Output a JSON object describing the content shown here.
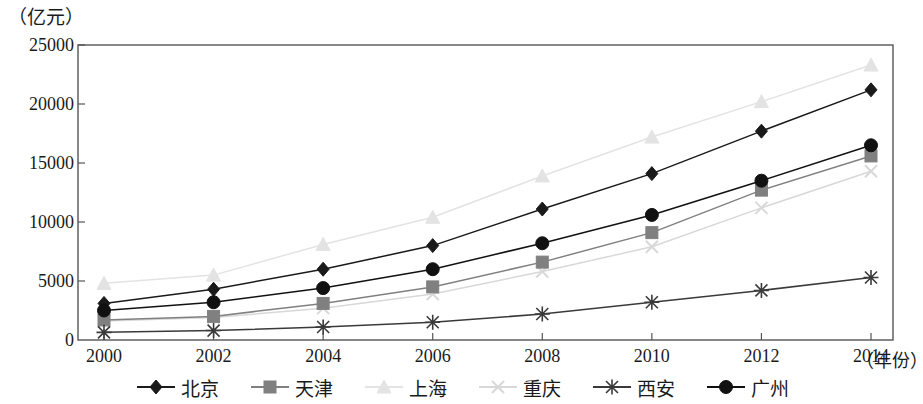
{
  "chart_data": {
    "type": "line",
    "title": "",
    "subtitle": "",
    "xlabel": "（年份）",
    "ylabel": "（亿元）",
    "x": [
      2000,
      2002,
      2004,
      2006,
      2008,
      2010,
      2012,
      2014
    ],
    "xtick_labels": [
      "2000",
      "2002",
      "2004",
      "2006",
      "2008",
      "2010",
      "2012",
      "2014"
    ],
    "ytick_labels": [
      "0",
      "5000",
      "10000",
      "15000",
      "20000",
      "25000"
    ],
    "ytick_values": [
      0,
      5000,
      10000,
      15000,
      20000,
      25000
    ],
    "xlim": [
      2000,
      2014
    ],
    "ylim": [
      0,
      25000
    ],
    "grid": false,
    "legend_position": "bottom",
    "series": [
      {
        "name": "北京",
        "marker": "diamond",
        "color": "#1a1a1a",
        "values": [
          3100,
          4300,
          6000,
          8000,
          11100,
          14100,
          17700,
          21200
        ]
      },
      {
        "name": "天津",
        "marker": "square",
        "color": "#808080",
        "values": [
          1700,
          2000,
          3100,
          4500,
          6600,
          9100,
          12700,
          15600
        ]
      },
      {
        "name": "上海",
        "marker": "triangle",
        "color": "#e3e3e3",
        "values": [
          4800,
          5500,
          8100,
          10400,
          13900,
          17200,
          20200,
          23300
        ]
      },
      {
        "name": "重庆",
        "marker": "cross",
        "color": "#d8d8d8",
        "values": [
          1600,
          1900,
          2700,
          3900,
          5800,
          7900,
          11200,
          14300
        ]
      },
      {
        "name": "西安",
        "marker": "asterisk",
        "color": "#3a3a3a",
        "values": [
          650,
          800,
          1100,
          1500,
          2200,
          3200,
          4200,
          5300
        ]
      },
      {
        "name": "广州",
        "marker": "circle",
        "color": "#111111",
        "values": [
          2500,
          3200,
          4400,
          6000,
          8200,
          10600,
          13500,
          16500
        ]
      }
    ]
  }
}
